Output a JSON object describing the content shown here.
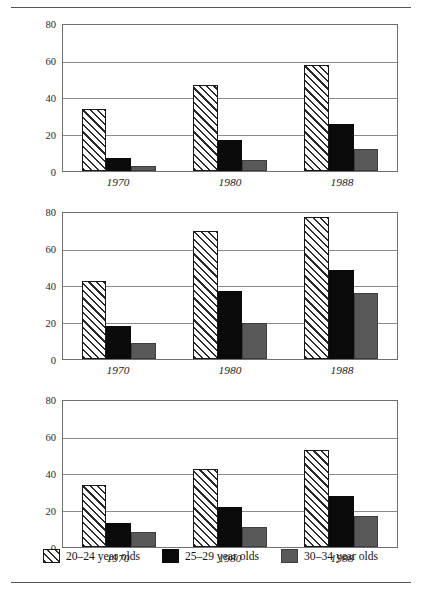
{
  "chart_data": {
    "type": "bar",
    "title": "",
    "xlabel": "",
    "categories": [
      "1970",
      "1980",
      "1988"
    ],
    "ylim": [
      0,
      80
    ],
    "yticks": [
      0,
      20,
      40,
      60,
      80
    ],
    "grid": true,
    "legend_position": "bottom",
    "panels": [
      {
        "ylabel": "Percent of White Women",
        "series": [
          {
            "name": "20–24 year olds",
            "values": [
              34,
              47,
              58
            ],
            "color": "#ffffff",
            "pattern": "diagonal-hatch"
          },
          {
            "name": "25–29 year olds",
            "values": [
              7,
              17,
              12
            ],
            "color": "#0a0a0a",
            "pattern": "solid"
          },
          {
            "name": "30–34 year olds",
            "values": [
              3,
              6,
              12
            ],
            "color": "#595959",
            "pattern": "solid"
          }
        ]
      },
      {
        "ylabel": "Percent of Black Women",
        "series": [
          {
            "name": "20–24 year olds",
            "values": [
              43,
              70,
              78
            ],
            "color": "#ffffff",
            "pattern": "diagonal-hatch"
          },
          {
            "name": "25–29 year olds",
            "values": [
              18,
              37,
              49
            ],
            "color": "#0a0a0a",
            "pattern": "solid"
          },
          {
            "name": "30–34 year olds",
            "values": [
              9,
              20,
              36
            ],
            "color": "#595959",
            "pattern": "solid"
          }
        ]
      },
      {
        "ylabel": "Percent of Hispanic Women",
        "series": [
          {
            "name": "20–24 year olds",
            "values": [
              34,
              43,
              53
            ],
            "color": "#ffffff",
            "pattern": "diagonal-hatch"
          },
          {
            "name": "25–29 year olds",
            "values": [
              13,
              22,
              28
            ],
            "color": "#0a0a0a",
            "pattern": "solid"
          },
          {
            "name": "30–34 year olds",
            "values": [
              8,
              11,
              17
            ],
            "color": "#595959",
            "pattern": "solid"
          }
        ]
      }
    ]
  },
  "panel_corrections": {
    "note": "panel 1 series 2 values",
    "white_25_29": [
      7,
      17,
      26
    ],
    "white_30_34": [
      3,
      6,
      12
    ]
  },
  "legend": {
    "items": [
      {
        "label": "20–24 year olds",
        "swatch": "diagonal-hatch"
      },
      {
        "label": "25–29 year olds",
        "swatch": "black-solid"
      },
      {
        "label": "30–34 year olds",
        "swatch": "gray-solid"
      }
    ]
  }
}
